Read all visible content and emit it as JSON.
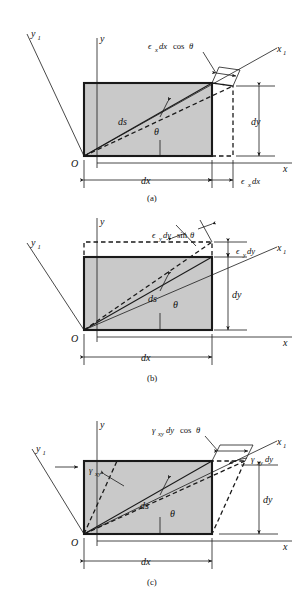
{
  "figure": {
    "background_color": "#ffffff",
    "shade_color": "#c9c9c9",
    "line_color": "#1a1a1a"
  },
  "panels": [
    {
      "caption": "(a)",
      "name": "normal-strain-x-panel",
      "axes": {
        "x": "x",
        "y": "y",
        "x1": "x1",
        "y1": "y1",
        "origin": "O"
      },
      "labels": {
        "diagonal": "ds",
        "angle": "θ",
        "top_dim": "ϵx dx cos θ",
        "bottom_dim": "ϵx dx",
        "width_dim": "dx",
        "height_dim": "dy"
      }
    },
    {
      "caption": "(b)",
      "name": "normal-strain-y-panel",
      "axes": {
        "x": "x",
        "y": "y",
        "x1": "x1",
        "y1": "y1",
        "origin": "O"
      },
      "labels": {
        "diagonal": "ds",
        "angle": "θ",
        "top_dim": "ϵy dy sin θ",
        "side_dim": "ϵy dy",
        "width_dim": "dx",
        "height_dim": "dy"
      }
    },
    {
      "caption": "(c)",
      "name": "shear-strain-panel",
      "axes": {
        "x": "x",
        "y": "y",
        "x1": "x1",
        "y1": "y1",
        "origin": "O"
      },
      "labels": {
        "diagonal": "ds",
        "angle": "θ",
        "shear_angle": "γxy",
        "top_dim": "γxy dy cos θ",
        "side_dim": "γxy dy",
        "width_dim": "dx",
        "height_dim": "dy"
      }
    }
  ],
  "glyphs": {
    "epsilon": "ϵ",
    "gamma": "γ",
    "theta": "θ",
    "sub_x": "x",
    "sub_y": "y",
    "sub_xy": "xy",
    "sub_1": "1",
    "dx": "dx",
    "dy": "dy",
    "ds": "ds",
    "cos": "cos",
    "sin": "sin"
  }
}
